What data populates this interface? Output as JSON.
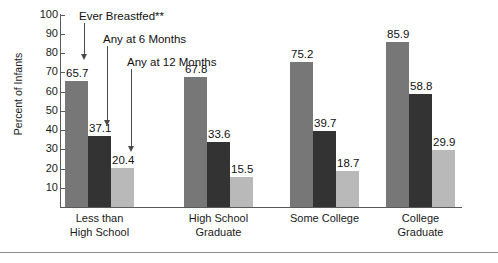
{
  "chart_data": {
    "type": "bar",
    "title": "",
    "subtitle": "",
    "xlabel": "",
    "ylabel": "Percent of Infants",
    "ylim": [
      0,
      100
    ],
    "y_ticks": [
      10,
      20,
      30,
      40,
      50,
      60,
      70,
      80,
      90,
      100
    ],
    "grid": false,
    "legend_position": "none",
    "categories": [
      "Less than\nHigh School",
      "High School\nGraduate",
      "Some College",
      "College\nGraduate"
    ],
    "series": [
      {
        "name": "Ever Breastfed**",
        "color": "#777777",
        "values": [
          65.7,
          67.8,
          75.2,
          85.9
        ]
      },
      {
        "name": "Any at 6 Months",
        "color": "#333333",
        "values": [
          37.1,
          33.6,
          39.7,
          58.8
        ]
      },
      {
        "name": "Any at 12 Months",
        "color": "#b9b9b9",
        "values": [
          20.4,
          15.5,
          18.7,
          29.9
        ]
      }
    ],
    "annotations": [
      {
        "text": "Ever Breastfed**",
        "target_series": 0,
        "target_category": 0
      },
      {
        "text": "Any at 6 Months",
        "target_series": 1,
        "target_category": 0
      },
      {
        "text": "Any at 12 Months",
        "target_series": 2,
        "target_category": 0
      }
    ],
    "value_labels": [
      [
        "65.7",
        "37.1",
        "20.4"
      ],
      [
        "67.8",
        "33.6",
        "15.5"
      ],
      [
        "75.2",
        "39.7",
        "18.7"
      ],
      [
        "85.9",
        "58.8",
        "29.9"
      ]
    ]
  }
}
